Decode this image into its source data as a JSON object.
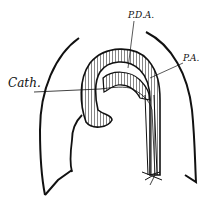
{
  "diagram": {
    "type": "anatomical line drawing",
    "labels": {
      "pda": "P.D.A.",
      "pa": "P.A.",
      "cath": "Cath."
    },
    "colors": {
      "ink": "#111111",
      "background": "#ffffff"
    }
  }
}
